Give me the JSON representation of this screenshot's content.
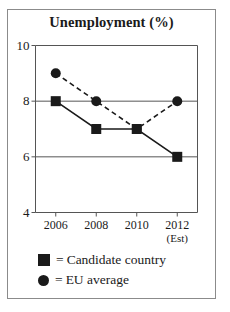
{
  "chart_data": {
    "type": "line",
    "title": "Unemployment (%)",
    "xlabel": "",
    "ylabel": "",
    "categories": [
      "2006",
      "2008",
      "2010",
      "2012"
    ],
    "x_tick_sublabels": [
      "",
      "",
      "",
      "(Est)"
    ],
    "ylim": [
      4,
      10
    ],
    "yticks": [
      4,
      6,
      8,
      10
    ],
    "grid": true,
    "legend_position": "below",
    "series": [
      {
        "name": "Candidate country",
        "marker": "square",
        "linestyle": "solid",
        "color": "#1a1a1a",
        "values": [
          8,
          7,
          7,
          6
        ]
      },
      {
        "name": "EU average",
        "marker": "circle",
        "linestyle": "dashed",
        "color": "#1a1a1a",
        "values": [
          9,
          8,
          7,
          8
        ]
      }
    ]
  },
  "legend": {
    "equals": "=",
    "entries": [
      {
        "label": "Candidate country",
        "marker": "square-marker"
      },
      {
        "label": "EU average",
        "marker": "circle-marker"
      }
    ]
  }
}
